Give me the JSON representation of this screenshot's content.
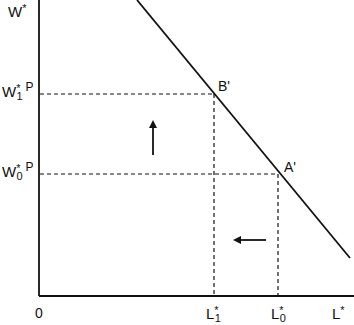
{
  "diagram": {
    "axes": {
      "y_label": "W",
      "y_label_sup": "*",
      "x_label": "L",
      "x_label_sup": "*",
      "origin_label": "0"
    },
    "y_ticks": [
      {
        "base": "W",
        "sup": "*",
        "sub": "1",
        "suffix": "P"
      },
      {
        "base": "W",
        "sup": "*",
        "sub": "0",
        "suffix": "P"
      }
    ],
    "x_ticks": [
      {
        "base": "L",
        "sup": "*",
        "sub": "1"
      },
      {
        "base": "L",
        "sup": "*",
        "sub": "0"
      }
    ],
    "points": [
      {
        "label": "B'"
      },
      {
        "label": "A'"
      }
    ],
    "arrows": [
      {
        "direction": "up"
      },
      {
        "direction": "left"
      }
    ],
    "colors": {
      "ink": "#111111",
      "background": "#ffffff"
    }
  }
}
